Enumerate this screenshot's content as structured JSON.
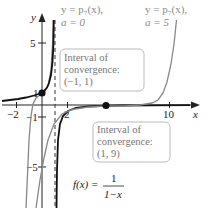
{
  "diagram": {
    "axes": {
      "x_label": "x",
      "y_label": "y",
      "x_ticks": [
        {
          "value": -2,
          "label": "−2"
        },
        {
          "value": 2,
          "label": "2"
        },
        {
          "value": 10,
          "label": "10"
        }
      ],
      "y_ticks": [
        {
          "value": 5,
          "label": "5"
        },
        {
          "value": 1,
          "label": "1"
        },
        {
          "value": -1,
          "label": "−1"
        },
        {
          "value": -5,
          "label": "−5"
        }
      ]
    },
    "curves": {
      "f": {
        "label_lhs": "f(x) =",
        "numerator": "1",
        "denominator": "1−x",
        "color": "#111111"
      },
      "p7_a0": {
        "line1": "y = p₇(x),",
        "line2": "a = 0",
        "color": "#888888"
      },
      "p7_a5": {
        "line1": "y = p₇(x),",
        "line2": "a = 5",
        "color": "#888888"
      }
    },
    "asymptote": {
      "x": 1,
      "style": "dashed"
    },
    "points": [
      {
        "x": 0,
        "y": 1
      },
      {
        "x": 5,
        "y": -0.25
      }
    ],
    "boxes": [
      {
        "line1": "Interval of",
        "line2": "convergence:",
        "line3": "(−1, 1)"
      },
      {
        "line1": "Interval of",
        "line2": "convergence:",
        "line3": "(1, 9)"
      }
    ]
  }
}
